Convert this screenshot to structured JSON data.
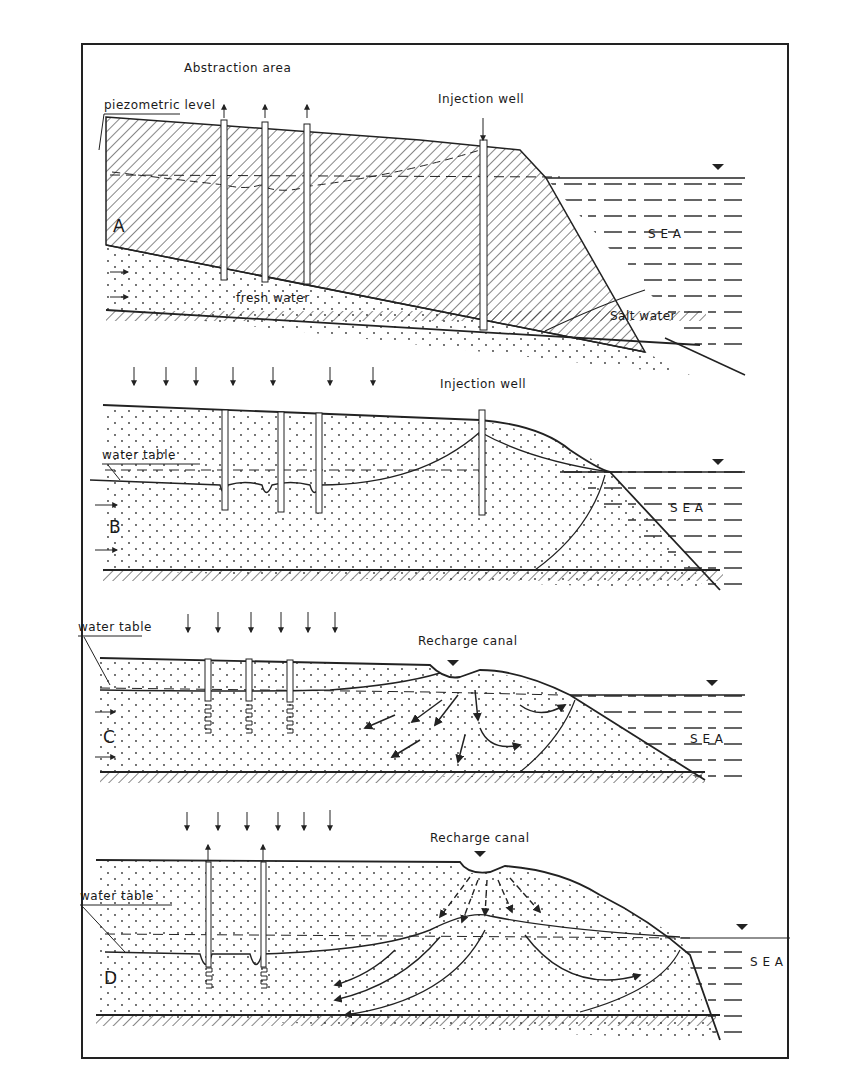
{
  "panels": [
    {
      "id": "A",
      "letter": "A",
      "labels": {
        "top": "Abstraction area",
        "left": "piezometric level",
        "well": "Injection well",
        "sea": "S E A",
        "salt": "Salt water",
        "fresh": "fresh water"
      }
    },
    {
      "id": "B",
      "letter": "B",
      "labels": {
        "well": "Injection well",
        "left": "water table",
        "sea": "S E A"
      }
    },
    {
      "id": "C",
      "letter": "C",
      "labels": {
        "canal": "Recharge canal",
        "left": "water table",
        "sea": "S E A"
      }
    },
    {
      "id": "D",
      "letter": "D",
      "labels": {
        "canal": "Recharge canal",
        "left": "water table",
        "sea": "S E A"
      }
    }
  ],
  "colors": {
    "ink": "#1a1a1a",
    "paper": "#ffffff"
  }
}
